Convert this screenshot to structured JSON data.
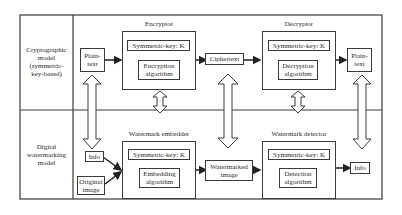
{
  "diagram": {
    "rows": [
      {
        "label": "Cryptographic\nmodel\n(symmetric-\nkey-based)"
      },
      {
        "label": "Digital\nwatermarking\nmodel"
      }
    ],
    "crypto": {
      "input": "Plain-\ntext",
      "encryptor": {
        "title": "Encryptor",
        "key": "Symmetric-key: K",
        "algorithm": "Encryption\nalgorithm"
      },
      "middle": "Ciphertext",
      "decryptor": {
        "title": "Decryptor",
        "key": "Symmetric-key: K",
        "algorithm": "Decryption\nalgorithm"
      },
      "output": "Plain-\ntext"
    },
    "watermark": {
      "input_info": "Info",
      "input_image": "Original\nimage",
      "embedder": {
        "title": "Watermark embedder",
        "key": "Symmetric-key: K",
        "algorithm": "Embedding\nalgorithm"
      },
      "middle": "Watermarked\nimage",
      "detector": {
        "title": "Watermark detector",
        "key": "Symmetric-key: K",
        "algorithm": "Detection\nalgorithm"
      },
      "output": "Info"
    },
    "colors": {
      "stroke": "#3a3a3a",
      "background": "#ffffff"
    }
  }
}
